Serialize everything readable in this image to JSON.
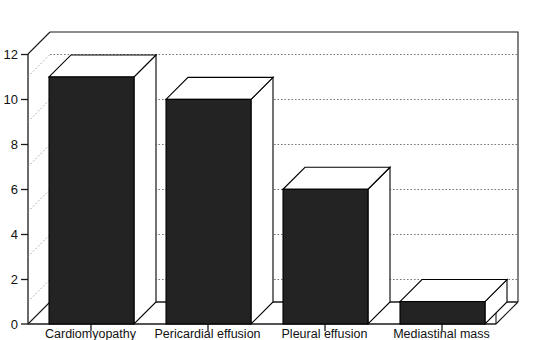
{
  "chart_data": {
    "type": "bar",
    "title": "",
    "subtitle": "",
    "xlabel": "",
    "ylabel": "",
    "categories": [
      "Cardiomyopathy",
      "Pericardial effusion",
      "Pleural effusion",
      "Mediastinal mass"
    ],
    "values": [
      11,
      10,
      6,
      1
    ],
    "series": [
      {
        "name": "Number of cases",
        "values": [
          11,
          10,
          6,
          1
        ]
      }
    ],
    "ylim": [
      0,
      12
    ],
    "ytick_labels": [
      "0",
      "2",
      "4",
      "6",
      "8",
      "10",
      "12"
    ],
    "ytick_values": [
      0,
      2,
      4,
      6,
      8,
      10,
      12
    ],
    "grid": true,
    "grid_values": [
      2,
      4,
      6,
      8,
      10,
      12
    ],
    "legend": false,
    "legend_position": "none",
    "three_d": true,
    "bar_face_color": "#232323",
    "bar_top_color": "#ffffff",
    "axis_color": "#1a1a1a",
    "grid_color": "#777777",
    "background_color": "#ffffff",
    "annotations": []
  },
  "axis": {
    "y_ticks": [
      {
        "label": "12",
        "value": 12
      },
      {
        "label": "10",
        "value": 10
      },
      {
        "label": "8",
        "value": 8
      },
      {
        "label": "6",
        "value": 6
      },
      {
        "label": "4",
        "value": 4
      },
      {
        "label": "2",
        "value": 2
      },
      {
        "label": "0",
        "value": 0
      }
    ],
    "x_ticks": [
      {
        "label": "Cardiomyopathy"
      },
      {
        "label": "Pericardial effusion"
      },
      {
        "label": "Pleural effusion"
      },
      {
        "label": "Mediastinal mass"
      }
    ]
  },
  "caption": {
    "text": ""
  }
}
